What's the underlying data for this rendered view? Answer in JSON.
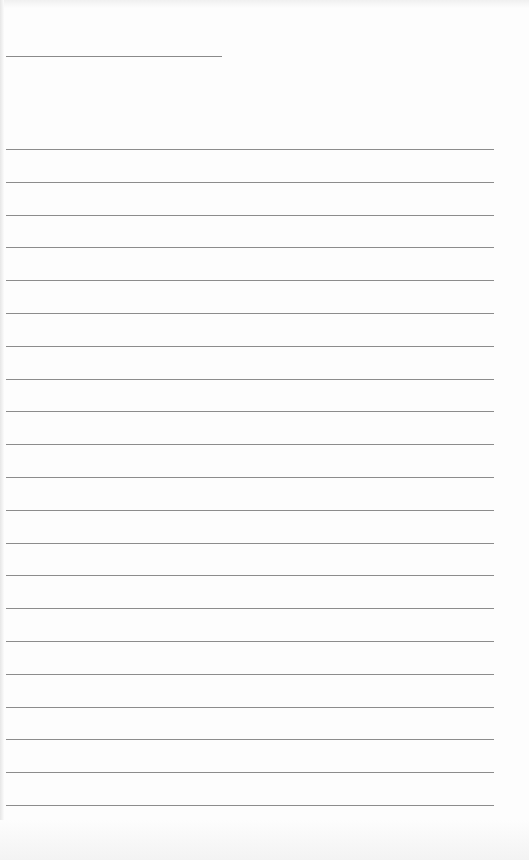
{
  "page": {
    "type": "blank lined sheet",
    "header_line": {
      "x": 6,
      "y": 56,
      "width": 216
    },
    "rules": {
      "count": 21,
      "x": 6,
      "width": 488,
      "first_y": 149,
      "spacing": 32.8
    },
    "colors": {
      "paper": "#fdfdfd",
      "line": "#8c8c8c"
    }
  }
}
